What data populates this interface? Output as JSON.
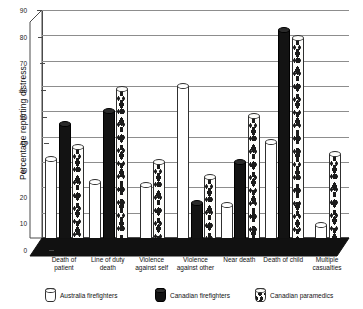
{
  "chart_data": {
    "type": "bar",
    "title": "",
    "xlabel": "",
    "ylabel": "Percentage reporting distress",
    "ylim": [
      0,
      90
    ],
    "yticks": [
      0,
      10,
      20,
      30,
      40,
      50,
      60,
      70,
      80,
      90
    ],
    "grid": true,
    "legend_position": "bottom",
    "style": "3d-cylinder-bars",
    "categories": [
      "Death of patient",
      "Line of duty death",
      "Violence against self",
      "Violence against other",
      "Near death",
      "Death of child",
      "Multiple casualties"
    ],
    "category_lines": [
      [
        "Death of",
        "patient"
      ],
      [
        "Line of duty",
        "death"
      ],
      [
        "Violence",
        "against self"
      ],
      [
        "Violence",
        "against other"
      ],
      [
        "Near death",
        ""
      ],
      [
        "Death of child",
        ""
      ],
      [
        "Multiple",
        "casualties"
      ]
    ],
    "series": [
      {
        "name": "Australia firefighters",
        "fill": "white",
        "color": "#ffffff",
        "values": [
          31,
          22,
          21,
          60,
          13,
          38,
          5
        ]
      },
      {
        "name": "Canadian firefighters",
        "fill": "black",
        "color": "#131313",
        "values": [
          45,
          50,
          null,
          14,
          30,
          82,
          null
        ]
      },
      {
        "name": "Canadian paramedics",
        "fill": "dotted",
        "color": "#fdfdfb",
        "values": [
          36,
          59,
          30,
          24,
          48,
          79,
          33
        ]
      }
    ]
  },
  "axis": {
    "y_title": "Percentage reporting distress",
    "tick_labels": [
      "90",
      "80",
      "70",
      "60",
      "50",
      "40",
      "30",
      "20",
      "10",
      "0"
    ]
  },
  "legend": {
    "items": [
      {
        "label": "Australia firefighters",
        "swatch": "white-cylinder-swatch"
      },
      {
        "label": "Canadian firefighters",
        "swatch": "black-cylinder-swatch"
      },
      {
        "label": "Canadian paramedics",
        "swatch": "dotted-cylinder-swatch"
      }
    ]
  }
}
